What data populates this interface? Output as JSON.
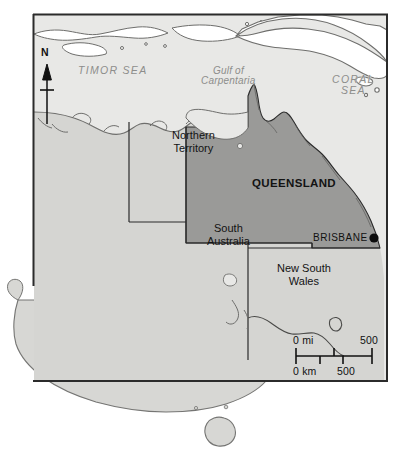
{
  "map": {
    "title": "Queensland, Australia reference map",
    "frame": {
      "x": 33,
      "y": 14,
      "width": 355,
      "height": 368
    },
    "colors": {
      "sea": "#e8e8e6",
      "land": "#d5d5d2",
      "highlight": "#9a9a98",
      "border_line": "#2b2b2b",
      "coast_line": "#6e6e6c",
      "ocean_text": "#8d8d8b",
      "land_text": "#131313",
      "page_background": "#ffffff"
    },
    "ocean_labels": [
      {
        "name": "timor-sea",
        "text": "TIMOR SEA",
        "style": "caps",
        "x": 78,
        "y": 72
      },
      {
        "name": "gulf-of-carpentaria",
        "line1": "Gulf of",
        "line2": "Carpentaria",
        "style": "mixed",
        "x": 213,
        "y": 73
      },
      {
        "name": "coral-sea",
        "line1": "CORAL",
        "line2": "SEA",
        "style": "caps",
        "x": 332,
        "y": 81
      }
    ],
    "state_labels": [
      {
        "name": "northern-territory",
        "line1": "Northern",
        "line2": "Territory",
        "x": 172,
        "y": 129,
        "highlighted": false
      },
      {
        "name": "queensland",
        "line1": "QUEENSLAND",
        "line2": "",
        "x": 252,
        "y": 176,
        "highlighted": true
      },
      {
        "name": "south-australia",
        "line1": "South",
        "line2": "Australia",
        "x": 207,
        "y": 222,
        "highlighted": false
      },
      {
        "name": "new-south-wales",
        "line1": "New South",
        "line2": "Wales",
        "x": 277,
        "y": 262,
        "highlighted": false
      }
    ],
    "cities": [
      {
        "name": "brisbane",
        "text": "BRISBANE",
        "label_x": 313,
        "label_y": 232,
        "dot_x": 374,
        "dot_y": 238,
        "dot_radius": 4.6
      }
    ],
    "compass": {
      "name": "north-arrow",
      "letter": "N",
      "letter_x": 41,
      "letter_y": 53,
      "shaft_x": 47,
      "shaft_top": 66,
      "shaft_bottom": 124,
      "crosshair_y": 90,
      "crosshair_half_width": 7
    },
    "scale_bar": {
      "name": "scale-bar",
      "bar_x": 296,
      "bar_y": 356,
      "bar_length": 76,
      "miles": {
        "label_zero": "0 mi",
        "label_max": "500",
        "ticks": [
          0,
          0.5,
          1.0
        ]
      },
      "kilometers": {
        "label_zero": "0 km",
        "label_max": "500",
        "ticks": [
          0,
          0.31,
          0.62
        ]
      }
    }
  }
}
